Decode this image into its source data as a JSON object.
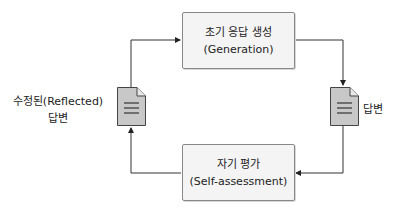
{
  "diagram": {
    "type": "cycle",
    "nodes": {
      "generation": {
        "line1": "초기 응답 생성",
        "line2": "(Generation)"
      },
      "self_assessment": {
        "line1": "자기 평가",
        "line2": "(Self-assessment)"
      },
      "answer": {
        "label": "답변",
        "icon": "document-icon"
      },
      "reflected_answer": {
        "line1": "수정된(Reflected)",
        "line2": "답변",
        "icon": "document-icon"
      }
    },
    "edges": [
      {
        "from": "reflected_answer",
        "to": "generation"
      },
      {
        "from": "generation",
        "to": "answer"
      },
      {
        "from": "answer",
        "to": "self_assessment"
      },
      {
        "from": "self_assessment",
        "to": "reflected_answer"
      }
    ],
    "colors": {
      "box_fill": "#f4f4f4",
      "box_border": "#888888",
      "doc_fill": "#c8c8c8",
      "line": "#333333"
    }
  }
}
